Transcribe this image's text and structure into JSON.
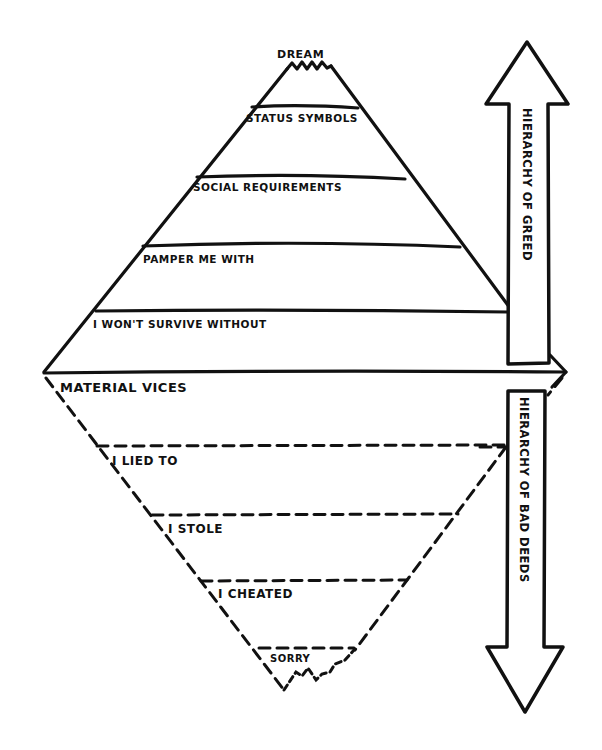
{
  "diagram": {
    "background": "#ffffff",
    "ink_color": "#111111",
    "style": "hand-drawn marker sketch",
    "greed_pyramid": {
      "line_style": "solid",
      "apex_label": "DREAM",
      "levels": [
        {
          "label": "STATUS SYMBOLS"
        },
        {
          "label": "SOCIAL REQUIREMENTS"
        },
        {
          "label": "PAMPER ME WITH"
        },
        {
          "label": "I WON'T SURVIVE WITHOUT"
        }
      ]
    },
    "deeds_pyramid": {
      "line_style": "dashed",
      "orientation": "inverted",
      "levels": [
        {
          "label": "MATERIAL VICES"
        },
        {
          "label": "I LIED TO"
        },
        {
          "label": "I STOLE"
        },
        {
          "label": "I CHEATED"
        },
        {
          "label": "SORRY"
        }
      ]
    },
    "arrows": {
      "up": {
        "direction": "up",
        "label": "HIERARCHY OF GREED"
      },
      "down": {
        "direction": "down",
        "label": "HIERARCHY OF BAD DEEDS"
      }
    }
  }
}
